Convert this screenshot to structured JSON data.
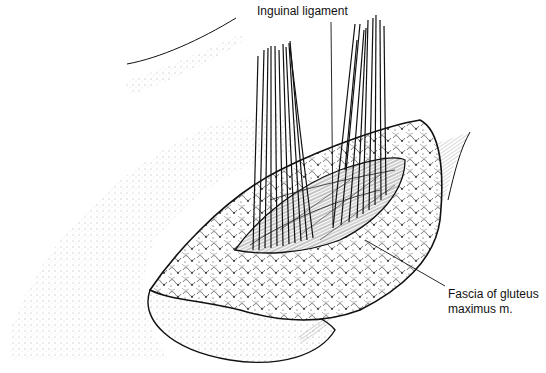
{
  "figure": {
    "type": "surgical anatomical line drawing",
    "labels": {
      "inguinal_ligament": "Inguinal ligament",
      "fascia_line1": "Fascia of gluteus",
      "fascia_line2": "maximus m."
    },
    "colors": {
      "background": "#ffffff",
      "ink": "#111111"
    }
  }
}
